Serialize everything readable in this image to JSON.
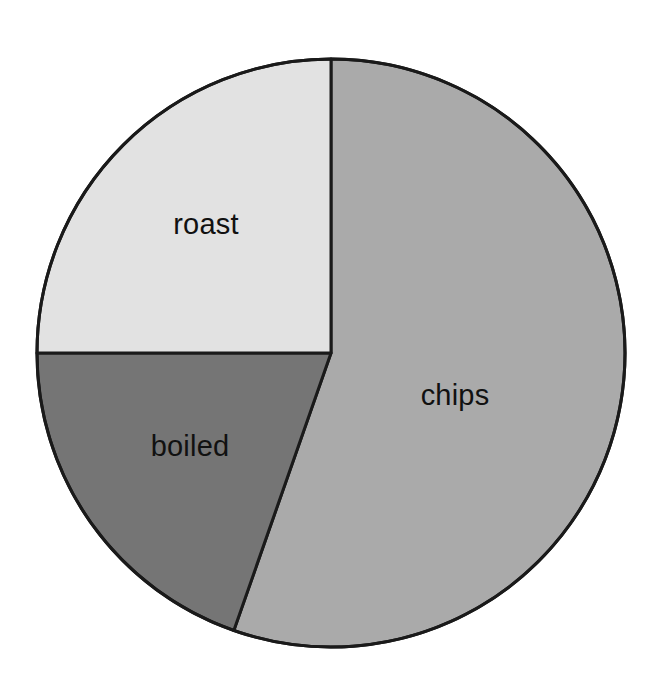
{
  "chart_data": {
    "type": "pie",
    "title": "",
    "subtitle": "",
    "xlabel": "",
    "ylabel": "",
    "grid": false,
    "legend": "none",
    "labels_position": "inside-slices",
    "start_angle_deg_from_top": 0,
    "direction": "clockwise",
    "categories": [
      "chips",
      "roast",
      "boiled"
    ],
    "values": [
      55.4,
      25.0,
      19.6
    ],
    "units": "percent",
    "slices": [
      {
        "label": "chips",
        "value": 55.4,
        "angle_deg": 199.3,
        "start_deg_from_top": 0,
        "end_deg_from_top": 199.3,
        "color": "#aaaaaa",
        "label_x": 455,
        "label_y": 397
      },
      {
        "label": "boiled",
        "value": 19.6,
        "angle_deg": 70.7,
        "start_deg_from_top": 199.3,
        "end_deg_from_top": 270,
        "color": "#757575",
        "label_x": 190,
        "label_y": 448
      },
      {
        "label": "roast",
        "value": 25.0,
        "angle_deg": 90,
        "start_deg_from_top": 270,
        "end_deg_from_top": 360,
        "color": "#e2e2e2",
        "label_x": 206,
        "label_y": 226
      }
    ],
    "geometry": {
      "center_x": 331,
      "center_y": 353,
      "radius": 294,
      "outline_color": "#1a1a1a",
      "outline_width": 3,
      "background": "#ffffff"
    }
  },
  "labels": {
    "chips": "chips",
    "roast": "roast",
    "boiled": "boiled"
  }
}
